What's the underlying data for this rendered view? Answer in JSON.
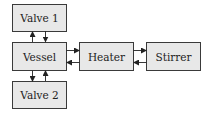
{
  "diagram": {
    "nodes": [
      {
        "id": "valve1",
        "label": "Valve 1",
        "x": 12,
        "y": 4,
        "w": 54,
        "h": 27
      },
      {
        "id": "vessel",
        "label": "Vessel",
        "x": 12,
        "y": 42,
        "w": 54,
        "h": 28
      },
      {
        "id": "heater",
        "label": "Heater",
        "x": 79,
        "y": 42,
        "w": 54,
        "h": 28
      },
      {
        "id": "stirrer",
        "label": "Stirrer",
        "x": 146,
        "y": 42,
        "w": 54,
        "h": 28
      },
      {
        "id": "valve2",
        "label": "Valve 2",
        "x": 12,
        "y": 81,
        "w": 54,
        "h": 27
      }
    ],
    "edges": [
      {
        "from": "vessel",
        "to": "valve1"
      },
      {
        "from": "valve1",
        "to": "vessel"
      },
      {
        "from": "vessel",
        "to": "valve2"
      },
      {
        "from": "valve2",
        "to": "vessel"
      },
      {
        "from": "vessel",
        "to": "heater"
      },
      {
        "from": "heater",
        "to": "vessel"
      },
      {
        "from": "heater",
        "to": "stirrer"
      },
      {
        "from": "stirrer",
        "to": "heater"
      }
    ],
    "colors": {
      "box_fill": "#e8e8e8",
      "box_stroke": "#3a3a3a",
      "arrow": "#222222"
    }
  }
}
